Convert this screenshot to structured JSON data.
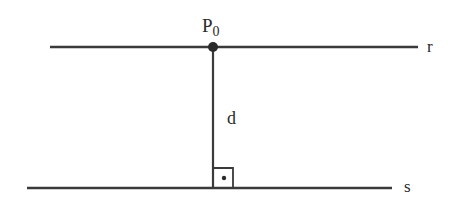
{
  "diagram": {
    "type": "geometry",
    "colors": {
      "stroke": "#3a3a3a",
      "text": "#2a2a2a",
      "background": "#ffffff"
    },
    "point": {
      "label_main": "P",
      "label_sub": "0"
    },
    "lines": [
      {
        "id": "r",
        "label": "r"
      },
      {
        "id": "s",
        "label": "s"
      }
    ],
    "segment": {
      "label": "d"
    },
    "right_angle_marker": true
  }
}
